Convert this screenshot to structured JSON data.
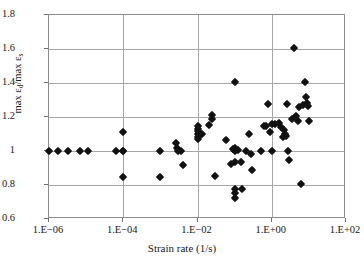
{
  "chart_data": {
    "type": "scatter",
    "title": "",
    "xlabel": "Strain rate (1/s)",
    "ylabel": "max εd/max εs",
    "ylabel_parts": {
      "prefix": "max ε",
      "sub1": "d",
      "mid": "/max ε",
      "sub2": "s"
    },
    "xscale": "log",
    "yscale": "linear",
    "xlim": [
      1e-06,
      100.0
    ],
    "ylim": [
      0.6,
      1.8
    ],
    "grid": true,
    "legend": "none",
    "marker": "diamond",
    "marker_color": "#111111",
    "xticks": [
      1e-06,
      0.0001,
      0.01,
      1.0,
      100.0
    ],
    "xtick_labels": [
      "1.E−06",
      "1.E−04",
      "1.E−02",
      "1.E+00",
      "1.E+02"
    ],
    "yticks": [
      0.6,
      0.8,
      1.0,
      1.2,
      1.4,
      1.6,
      1.8
    ],
    "ytick_labels": [
      "0.6",
      "0.8",
      "1",
      "1.2",
      "1.4",
      "1.6",
      "1.8"
    ],
    "n_points": 75,
    "points": [
      {
        "x": 1e-06,
        "y": 1.0
      },
      {
        "x": 1.7e-06,
        "y": 1.0
      },
      {
        "x": 3.2e-06,
        "y": 1.0
      },
      {
        "x": 7e-06,
        "y": 1.0
      },
      {
        "x": 1.1e-05,
        "y": 1.0
      },
      {
        "x": 6.5e-05,
        "y": 1.0
      },
      {
        "x": 0.0001,
        "y": 1.0
      },
      {
        "x": 0.0001,
        "y": 1.11
      },
      {
        "x": 0.0001,
        "y": 1.0
      },
      {
        "x": 0.0001,
        "y": 0.85
      },
      {
        "x": 0.001,
        "y": 1.0
      },
      {
        "x": 0.001,
        "y": 0.85
      },
      {
        "x": 0.0026,
        "y": 1.05
      },
      {
        "x": 0.0028,
        "y": 1.02
      },
      {
        "x": 0.003,
        "y": 1.0
      },
      {
        "x": 0.0036,
        "y": 1.0
      },
      {
        "x": 0.004,
        "y": 0.915
      },
      {
        "x": 0.01,
        "y": 1.15
      },
      {
        "x": 0.01,
        "y": 1.13
      },
      {
        "x": 0.01,
        "y": 1.12
      },
      {
        "x": 0.01,
        "y": 1.1
      },
      {
        "x": 0.01,
        "y": 1.085
      },
      {
        "x": 0.01,
        "y": 1.07
      },
      {
        "x": 0.024,
        "y": 1.21
      },
      {
        "x": 0.025,
        "y": 1.19
      },
      {
        "x": 0.03,
        "y": 0.855
      },
      {
        "x": 0.06,
        "y": 1.065
      },
      {
        "x": 0.08,
        "y": 0.925
      },
      {
        "x": 0.1,
        "y": 1.405
      },
      {
        "x": 0.1,
        "y": 1.015
      },
      {
        "x": 0.1,
        "y": 1.0
      },
      {
        "x": 0.1,
        "y": 0.935
      },
      {
        "x": 0.1,
        "y": 0.775
      },
      {
        "x": 0.1,
        "y": 0.755
      },
      {
        "x": 0.1,
        "y": 0.725
      },
      {
        "x": 0.15,
        "y": 0.935
      },
      {
        "x": 0.16,
        "y": 0.775
      },
      {
        "x": 0.25,
        "y": 1.1
      },
      {
        "x": 0.28,
        "y": 0.985
      },
      {
        "x": 0.3,
        "y": 0.89
      },
      {
        "x": 0.7,
        "y": 1.145
      },
      {
        "x": 0.8,
        "y": 1.275
      },
      {
        "x": 0.9,
        "y": 1.11
      },
      {
        "x": 1.0,
        "y": 1.16
      },
      {
        "x": 1.0,
        "y": 1.0
      },
      {
        "x": 1.6,
        "y": 1.165
      },
      {
        "x": 1.8,
        "y": 1.14
      },
      {
        "x": 2.2,
        "y": 1.125
      },
      {
        "x": 2.3,
        "y": 1.1
      },
      {
        "x": 2.4,
        "y": 1.09
      },
      {
        "x": 2.6,
        "y": 1.275
      },
      {
        "x": 2.8,
        "y": 1.0
      },
      {
        "x": 3.0,
        "y": 0.945
      },
      {
        "x": 4.0,
        "y": 1.605
      },
      {
        "x": 4.5,
        "y": 1.205
      },
      {
        "x": 5.0,
        "y": 1.175
      },
      {
        "x": 5.5,
        "y": 1.26
      },
      {
        "x": 6.0,
        "y": 0.805
      },
      {
        "x": 8.0,
        "y": 1.405
      },
      {
        "x": 8.5,
        "y": 1.32
      },
      {
        "x": 9.0,
        "y": 1.28
      },
      {
        "x": 9.5,
        "y": 1.265
      },
      {
        "x": 10.0,
        "y": 1.175
      },
      {
        "x": 0.02,
        "y": 1.155
      },
      {
        "x": 0.12,
        "y": 1.005
      },
      {
        "x": 0.5,
        "y": 1.0
      },
      {
        "x": 1.2,
        "y": 1.16
      },
      {
        "x": 2.0,
        "y": 1.085
      },
      {
        "x": 3.5,
        "y": 1.19
      },
      {
        "x": 7.0,
        "y": 1.27
      },
      {
        "x": 0.013,
        "y": 1.1
      },
      {
        "x": 0.09,
        "y": 1.01
      },
      {
        "x": 0.2,
        "y": 1.0
      },
      {
        "x": 0.6,
        "y": 1.15
      }
    ]
  }
}
